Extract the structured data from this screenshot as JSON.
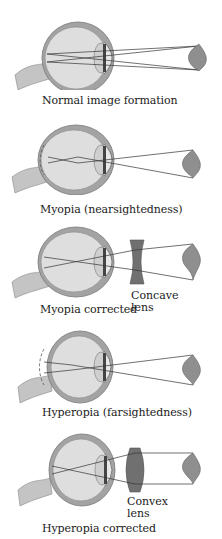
{
  "figure": {
    "panels": [
      {
        "id": "normal",
        "caption": "Normal image formation",
        "lens": null
      },
      {
        "id": "myopia",
        "caption": "Myopia (nearsightedness)",
        "lens": null
      },
      {
        "id": "myopia-corrected",
        "caption": "Myopia corrected",
        "lens": {
          "type": "concave",
          "label_line1": "Concave",
          "label_line2": "lens"
        }
      },
      {
        "id": "hyperopia",
        "caption": "Hyperopia (farsightedness)",
        "lens": null
      },
      {
        "id": "hyperopia-corrected",
        "caption": "Hyperopia corrected",
        "lens": {
          "type": "convex",
          "label_line1": "Convex",
          "label_line2": "lens"
        }
      }
    ],
    "colors": {
      "sclera": "#9a9a9a",
      "vitreous": "#dcdcdc",
      "lens": "#c8c8c8",
      "corrective_lens": "#6e6e6e",
      "nerve": "#c0c0c0",
      "rays": "#333333",
      "leaf": "#8a8a8a"
    }
  }
}
